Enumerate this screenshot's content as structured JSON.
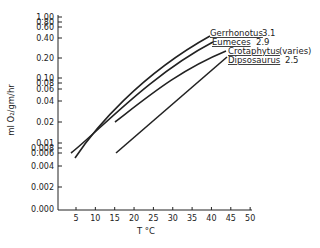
{
  "chart_data": {
    "type": "line",
    "title": "",
    "xlabel": "T °C",
    "ylabel": "ml O2/gm/hr",
    "xlim": [
      0,
      50
    ],
    "x_ticks": [
      "5",
      "10",
      "15",
      "20",
      "25",
      "30",
      "35",
      "40",
      "45",
      "50"
    ],
    "y_scale": "log",
    "y_ticks": [
      "1.00",
      "0.80",
      "0.60",
      "0.40",
      "0.20",
      "0.10",
      "0.08",
      "0.06",
      "0.04",
      "0.02",
      "0.01",
      "0.008",
      "0.006",
      "0.004",
      "0.002",
      "0.000"
    ],
    "grid": false,
    "legend_position": "inline, upper right (labels at line ends)",
    "series": [
      {
        "name": "Gerrhonotus",
        "annotation": "3.1",
        "x": [
          6,
          10,
          15,
          20,
          25,
          30,
          35,
          39
        ],
        "y": [
          0.006,
          0.012,
          0.03,
          0.07,
          0.14,
          0.25,
          0.4,
          0.55
        ]
      },
      {
        "name": "Eumeces",
        "annotation": "2.9",
        "x": [
          5,
          10,
          15,
          20,
          25,
          30,
          35,
          40
        ],
        "y": [
          0.008,
          0.012,
          0.025,
          0.055,
          0.11,
          0.2,
          0.33,
          0.48
        ]
      },
      {
        "name": "Crotaphytus",
        "annotation": "(varies)",
        "x": [
          15,
          20,
          25,
          30,
          35,
          40
        ],
        "y": [
          0.035,
          0.07,
          0.13,
          0.22,
          0.33,
          0.45
        ]
      },
      {
        "name": "Dipsosaurus",
        "annotation": "2.5",
        "x": [
          15,
          20,
          25,
          30,
          35,
          40,
          45
        ],
        "y": [
          0.022,
          0.038,
          0.065,
          0.11,
          0.18,
          0.28,
          0.4
        ]
      }
    ]
  },
  "axes": {
    "xlabel": "T °C",
    "ylabel": "ml O₂/gm/hr"
  },
  "legend": [
    {
      "name": "Gerrhonotus",
      "value": "3.1"
    },
    {
      "name": "Eumeces",
      "value": "2.9"
    },
    {
      "name": "Crotaphytus",
      "value": "(varies)"
    },
    {
      "name": "Dipsosaurus",
      "value": "2.5"
    }
  ]
}
